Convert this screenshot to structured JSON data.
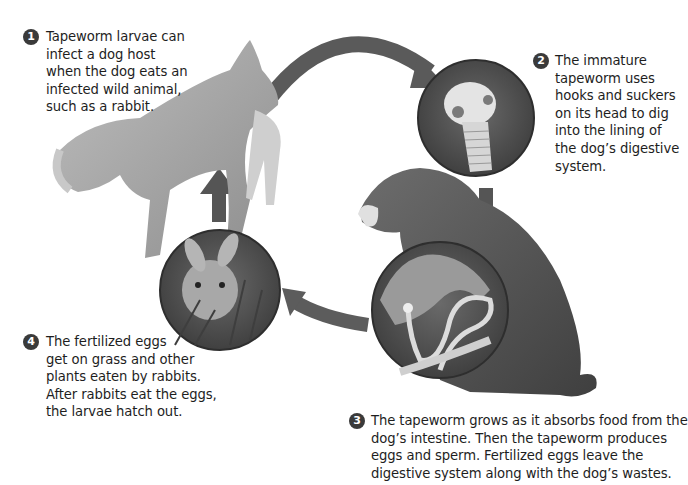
{
  "steps": [
    {
      "number": "1",
      "lines": [
        "Tapeworm larvae can",
        "infect a dog host",
        "when the dog eats an",
        "infected wild animal,",
        "such as a rabbit."
      ]
    },
    {
      "number": "2",
      "lines": [
        "The immature",
        "tapeworm uses",
        "hooks and suckers",
        "on its head to dig",
        "into the lining of",
        "the dog’s digestive",
        "system."
      ]
    },
    {
      "number": "3",
      "lines": [
        "The tapeworm grows as it absorbs food from the",
        "dog’s intestine. Then the tapeworm produces",
        "eggs and sperm. Fertilized eggs leave the",
        "digestive system along with the dog’s wastes."
      ]
    },
    {
      "number": "4",
      "lines": [
        "The fertilized eggs",
        "get on grass and other",
        "plants eaten by rabbits.",
        "After rabbits eat the eggs,",
        "the larvae hatch out."
      ]
    }
  ],
  "illustrations": {
    "leaping_dog": "Dog leaping and catching a wild animal",
    "tapeworm_head": "Close-up of tapeworm head with hooks and suckers",
    "sitting_dog": "Sitting dog host",
    "intestine": "Tapeworm inside dog's intestine",
    "rabbit": "Rabbit eating grass"
  },
  "colors": {
    "arrow": "#555555",
    "circle_bg": "#5a5a5a",
    "text": "#1e1e1e",
    "badge": "#3a3a3a"
  }
}
